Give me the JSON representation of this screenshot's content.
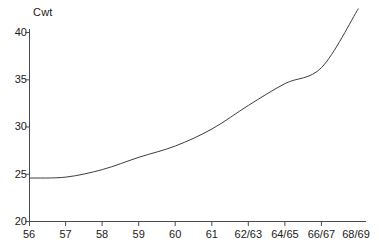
{
  "chart_data": {
    "type": "line",
    "title": "",
    "subtitle": "",
    "xlabel": "",
    "ylabel": "Cwt",
    "ylim": [
      20,
      42.5
    ],
    "xlim": [
      0,
      9
    ],
    "grid": false,
    "legend": null,
    "y_ticks": [
      40,
      35,
      30,
      25,
      20
    ],
    "x_ticks": [
      "56",
      "57",
      "58",
      "59",
      "60",
      "61",
      "62/63",
      "64/65",
      "66/67",
      "68/69"
    ],
    "categories": [
      "56",
      "57",
      "58",
      "59",
      "60",
      "61",
      "62/63",
      "64/65",
      "66/67",
      "68/69"
    ],
    "values": [
      24.6,
      24.7,
      25.5,
      26.8,
      28.0,
      29.8,
      32.3,
      34.6,
      36.3,
      42.5
    ],
    "series": [
      {
        "name": "Cwt",
        "values": [
          24.6,
          24.7,
          25.5,
          26.8,
          28.0,
          29.8,
          32.3,
          34.6,
          36.3,
          42.5
        ]
      }
    ],
    "annotations": [
      "curve is flat between 56 and 57 at about 24.6 Cwt",
      "slight plateau at about 36 Cwt between 66 and 66/67",
      "steep rise after 66/67 up to 42.5 Cwt at 68/69"
    ],
    "line_color": "#3c3c46",
    "axis_color": "#4a4a52"
  },
  "axis": {
    "y_unit_label": "Cwt",
    "y_labels": [
      "40",
      "35",
      "30",
      "25",
      "20"
    ],
    "x_labels": [
      "56",
      "57",
      "58",
      "59",
      "60",
      "61",
      "62/63",
      "64/65",
      "66/67",
      "68/69"
    ]
  },
  "colors": {
    "line": "#3c3c46",
    "axis": "#4a4a52",
    "text": "#1a1a1a",
    "background": "#ffffff"
  }
}
